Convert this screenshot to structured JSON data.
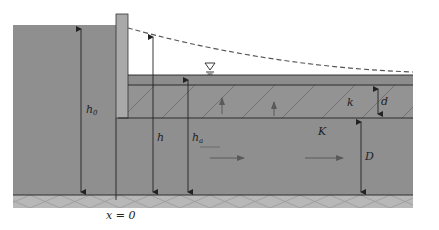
{
  "diagram": {
    "colors": {
      "aquifer": "#8f8f8f",
      "semipervious_layer": "#939393",
      "top_strip": "#8d8d8d",
      "wall": "#a9a9a9",
      "base": "#b8b8b8",
      "lines": "#222222",
      "dashed_curve": "#555555",
      "flow_arrow": "#5a5a5a"
    },
    "labels": {
      "h0": "h",
      "h0_sub": "0",
      "h": "h",
      "ha": "h",
      "ha_sub": "a",
      "k": "k",
      "d": "d",
      "K": "K",
      "D": "D",
      "x0": "x = 0"
    },
    "symbols": {
      "water_table": "water-level-triangle"
    },
    "dimensions": [
      {
        "name": "h0",
        "x": 81,
        "y_top": 25,
        "y_bottom": 195
      },
      {
        "name": "h",
        "x": 153,
        "y_top": 33,
        "y_bottom": 195
      },
      {
        "name": "ha",
        "x": 188,
        "y_top": 76,
        "y_bottom": 195
      },
      {
        "name": "d",
        "x": 378,
        "y_top": 86,
        "y_bottom": 117
      },
      {
        "name": "D",
        "x": 361,
        "y_top": 119,
        "y_bottom": 194
      }
    ]
  }
}
